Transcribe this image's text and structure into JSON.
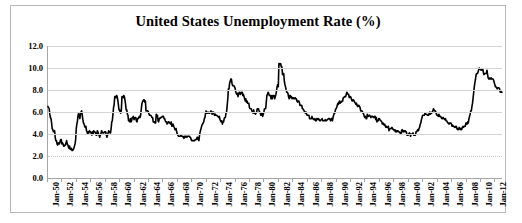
{
  "chart": {
    "title": "United States Unemployment Rate (%)",
    "border_color": "#b8b8b8",
    "gridline_color": "#d4d4d4",
    "series_color": "#000000"
  },
  "chart_data": {
    "type": "line",
    "title": "United States Unemployment Rate (%)",
    "xlabel": "",
    "ylabel": "",
    "ylim": [
      0.0,
      12.0
    ],
    "ytick_labels": [
      "0.0",
      "2.0",
      "4.0",
      "6.0",
      "8.0",
      "10.0",
      "12.0"
    ],
    "ytick_values": [
      0.0,
      2.0,
      4.0,
      6.0,
      8.0,
      10.0,
      12.0
    ],
    "grid": true,
    "legend": "none",
    "xtick_labels": [
      "Jan-50",
      "Jan-52",
      "Jan-54",
      "Jan-56",
      "Jan-58",
      "Jan-60",
      "Jan-62",
      "Jan-64",
      "Jan-66",
      "Jan-68",
      "Jan-70",
      "Jan-72",
      "Jan-74",
      "Jan-76",
      "Jan-78",
      "Jan-80",
      "Jan-82",
      "Jan-84",
      "Jan-86",
      "Jan-88",
      "Jan-90",
      "Jan-92",
      "Jan-94",
      "Jan-96",
      "Jan-98",
      "Jan-00",
      "Jan-02",
      "Jan-04",
      "Jan-06",
      "Jan-08",
      "Jan-10",
      "Jan-12"
    ],
    "x_start_year": 1950,
    "x_end_year": 2012,
    "x_frequency": "monthly",
    "series": [
      {
        "name": "Unemployment Rate",
        "values": [
          6.5,
          6.4,
          6.3,
          5.8,
          5.5,
          5.4,
          5.0,
          4.5,
          4.4,
          4.2,
          4.2,
          4.3,
          3.7,
          3.4,
          3.4,
          3.1,
          3.0,
          3.2,
          3.1,
          3.1,
          3.3,
          3.5,
          3.5,
          3.1,
          3.2,
          3.1,
          2.9,
          2.9,
          3.0,
          3.0,
          3.2,
          3.4,
          3.1,
          3.0,
          2.8,
          2.7,
          2.9,
          2.6,
          2.6,
          2.7,
          2.5,
          2.5,
          2.6,
          2.7,
          2.9,
          3.1,
          3.5,
          4.5,
          4.9,
          5.2,
          5.7,
          5.9,
          5.6,
          5.4,
          5.8,
          6.0,
          6.1,
          5.7,
          5.3,
          5.0,
          4.9,
          4.7,
          4.6,
          4.7,
          4.3,
          4.2,
          4.0,
          4.2,
          4.1,
          4.3,
          4.2,
          4.2,
          4.0,
          3.9,
          4.2,
          4.0,
          4.3,
          4.2,
          4.2,
          4.1,
          3.9,
          3.9,
          4.3,
          4.2,
          4.0,
          3.9,
          3.7,
          3.9,
          4.0,
          4.3,
          4.2,
          4.1,
          4.1,
          4.1,
          4.2,
          4.2,
          4.2,
          3.9,
          3.7,
          3.9,
          4.1,
          4.3,
          4.2,
          4.1,
          4.1,
          4.5,
          5.1,
          5.2,
          5.8,
          6.4,
          6.7,
          7.4,
          7.4,
          7.3,
          7.5,
          7.4,
          7.1,
          6.7,
          6.2,
          6.2,
          6.0,
          5.9,
          6.2,
          7.4,
          7.4,
          7.3,
          7.5,
          7.4,
          7.1,
          6.7,
          6.2,
          6.2,
          5.8,
          5.7,
          5.2,
          5.2,
          5.1,
          5.4,
          5.1,
          5.2,
          5.5,
          5.5,
          5.6,
          5.3,
          5.4,
          5.5,
          5.5,
          5.2,
          5.1,
          5.4,
          5.4,
          5.5,
          5.6,
          5.5,
          5.7,
          6.2,
          6.7,
          6.9,
          7.0,
          7.1,
          7.1,
          6.9,
          7.0,
          6.1,
          6.1,
          6.1,
          6.1,
          6.0,
          5.8,
          5.7,
          5.7,
          5.7,
          5.6,
          5.5,
          5.5,
          5.1,
          5.1,
          5.1,
          5.0,
          5.0,
          5.8,
          5.7,
          5.7,
          5.2,
          5.1,
          5.4,
          5.4,
          5.5,
          5.5,
          5.5,
          5.6,
          5.6,
          5.6,
          5.4,
          5.4,
          5.2,
          5.1,
          5.1,
          4.9,
          5.0,
          5.1,
          5.1,
          5.0,
          5.0,
          4.9,
          5.1,
          4.7,
          4.8,
          4.9,
          4.7,
          4.6,
          4.4,
          4.4,
          4.5,
          4.2,
          4.0,
          3.9,
          3.8,
          3.8,
          3.8,
          3.8,
          3.9,
          3.8,
          3.8,
          3.8,
          3.7,
          3.6,
          3.8,
          3.7,
          3.8,
          3.8,
          3.7,
          3.8,
          3.8,
          3.8,
          3.8,
          3.7,
          3.7,
          3.5,
          3.4,
          3.4,
          3.4,
          3.4,
          3.4,
          3.4,
          3.5,
          3.5,
          3.5,
          3.7,
          3.7,
          3.5,
          3.4,
          3.9,
          4.2,
          4.4,
          4.6,
          4.8,
          4.9,
          5.0,
          5.1,
          5.4,
          5.5,
          5.9,
          6.1,
          5.9,
          5.9,
          6.0,
          5.9,
          5.9,
          5.9,
          6.0,
          6.1,
          6.0,
          5.8,
          6.0,
          6.0,
          5.8,
          5.7,
          5.8,
          5.7,
          5.7,
          5.7,
          5.6,
          5.6,
          5.5,
          5.6,
          5.3,
          5.2,
          5.1,
          5.2,
          4.9,
          5.1,
          5.1,
          5.4,
          5.5,
          5.5,
          5.9,
          6.0,
          6.6,
          7.2,
          8.1,
          8.1,
          8.6,
          8.8,
          9.0,
          9.0,
          8.6,
          8.4,
          8.4,
          8.4,
          8.3,
          8.2,
          7.9,
          7.7,
          7.6,
          7.7,
          7.4,
          7.6,
          7.8,
          7.8,
          7.6,
          7.7,
          7.8,
          7.8,
          7.5,
          7.6,
          7.4,
          7.2,
          7.0,
          7.2,
          6.9,
          7.0,
          6.8,
          6.8,
          6.8,
          6.4,
          6.3,
          6.3,
          6.3,
          6.1,
          6.0,
          5.9,
          6.2,
          5.9,
          5.9,
          5.8,
          5.9,
          6.0,
          6.3,
          6.3,
          6.3,
          6.1,
          6.0,
          5.9,
          5.7,
          5.7,
          5.9,
          5.6,
          5.8,
          6.0,
          6.3,
          6.3,
          6.3,
          6.9,
          7.5,
          7.6,
          7.8,
          7.7,
          7.5,
          7.5,
          7.5,
          7.2,
          7.5,
          7.2,
          7.5,
          7.5,
          7.5,
          7.2,
          7.4,
          7.6,
          7.9,
          8.3,
          8.5,
          8.3,
          10.4,
          10.4,
          10.3,
          10.4,
          10.1,
          10.1,
          9.4,
          9.5,
          9.5,
          8.8,
          8.5,
          8.3,
          8.0,
          7.8,
          7.8,
          7.7,
          7.4,
          7.2,
          7.5,
          7.5,
          7.3,
          7.4,
          7.2,
          7.3,
          7.3,
          7.2,
          7.2,
          7.3,
          7.2,
          7.2,
          7.0,
          6.9,
          7.0,
          7.0,
          6.9,
          6.6,
          6.6,
          6.6,
          6.6,
          6.3,
          6.3,
          6.2,
          6.1,
          6.0,
          5.9,
          6.0,
          5.8,
          5.7,
          5.7,
          5.7,
          5.7,
          5.4,
          5.4,
          5.4,
          5.4,
          5.6,
          5.4,
          5.4,
          5.3,
          5.3,
          5.4,
          5.2,
          5.2,
          5.4,
          5.4,
          5.3,
          5.4,
          5.3,
          5.2,
          5.2,
          5.3,
          5.3,
          5.4,
          5.2,
          5.2,
          5.2,
          5.2,
          5.3,
          5.2,
          5.2,
          5.3,
          5.3,
          5.4,
          5.4,
          5.4,
          5.3,
          5.2,
          5.4,
          5.4,
          5.2,
          5.5,
          5.7,
          5.9,
          5.9,
          6.2,
          6.3,
          6.4,
          6.6,
          6.8,
          6.7,
          6.9,
          7.0,
          6.8,
          6.9,
          6.9,
          7.0,
          7.0,
          7.3,
          7.3,
          7.4,
          7.4,
          7.4,
          7.6,
          7.8,
          7.7,
          7.6,
          7.6,
          7.3,
          7.4,
          7.4,
          7.3,
          7.1,
          7.0,
          7.1,
          7.1,
          7.0,
          6.9,
          6.8,
          6.7,
          6.8,
          6.6,
          6.5,
          6.6,
          6.6,
          6.5,
          6.4,
          6.1,
          6.1,
          6.1,
          6.0,
          5.9,
          5.8,
          5.6,
          5.5,
          5.6,
          5.4,
          5.4,
          5.8,
          5.6,
          5.6,
          5.7,
          5.7,
          5.6,
          5.5,
          5.6,
          5.6,
          5.6,
          5.5,
          5.5,
          5.6,
          5.6,
          5.3,
          5.5,
          5.1,
          5.2,
          5.2,
          5.4,
          5.4,
          5.3,
          5.2,
          5.2,
          5.1,
          4.9,
          5.0,
          4.9,
          4.8,
          4.9,
          4.7,
          4.6,
          4.7,
          4.6,
          4.6,
          4.7,
          4.3,
          4.4,
          4.5,
          4.5,
          4.5,
          4.6,
          4.5,
          4.4,
          4.4,
          4.3,
          4.4,
          4.2,
          4.3,
          4.2,
          4.3,
          4.3,
          4.2,
          4.2,
          4.1,
          4.1,
          4.0,
          4.3,
          4.4,
          4.2,
          4.3,
          4.2,
          4.3,
          4.3,
          4.2,
          4.2,
          3.9,
          3.9,
          3.9,
          4.0,
          4.1,
          4.0,
          3.8,
          4.0,
          4.0,
          4.0,
          4.1,
          3.9,
          3.9,
          3.9,
          3.9,
          4.2,
          4.2,
          4.3,
          4.4,
          4.3,
          4.5,
          4.6,
          4.9,
          5.0,
          5.3,
          5.5,
          5.7,
          5.7,
          5.7,
          5.7,
          5.9,
          5.8,
          5.8,
          5.8,
          5.7,
          5.7,
          5.7,
          5.9,
          6.0,
          5.8,
          5.9,
          5.9,
          6.0,
          6.1,
          6.3,
          6.2,
          6.1,
          6.1,
          6.0,
          5.8,
          5.7,
          5.7,
          5.6,
          5.8,
          5.6,
          5.6,
          5.6,
          5.5,
          5.4,
          5.4,
          5.5,
          5.4,
          5.4,
          5.3,
          5.4,
          5.2,
          5.2,
          5.1,
          5.0,
          5.0,
          4.9,
          5.0,
          5.0,
          5.0,
          4.9,
          4.7,
          4.8,
          4.7,
          4.7,
          4.6,
          4.6,
          4.7,
          4.7,
          4.5,
          4.4,
          4.5,
          4.4,
          4.6,
          4.5,
          4.4,
          4.5,
          4.4,
          4.6,
          4.7,
          4.6,
          4.7,
          4.7,
          4.7,
          5.0,
          5.0,
          4.9,
          5.1,
          5.0,
          5.4,
          5.6,
          5.8,
          6.1,
          6.1,
          6.5,
          6.8,
          7.3,
          7.8,
          8.3,
          8.7,
          9.0,
          9.4,
          9.5,
          9.5,
          9.6,
          9.8,
          10.0,
          9.9,
          9.9,
          9.8,
          9.8,
          9.9,
          9.9,
          9.6,
          9.4,
          9.5,
          9.5,
          9.5,
          9.5,
          9.8,
          9.4,
          9.1,
          9.0,
          9.0,
          9.1,
          9.0,
          9.1,
          9.0,
          9.0,
          9.0,
          8.9,
          8.7,
          8.5,
          8.3,
          8.3,
          8.2,
          8.1,
          8.2,
          8.2,
          8.2,
          8.1,
          7.8,
          7.9,
          7.8,
          7.8
        ]
      }
    ]
  }
}
